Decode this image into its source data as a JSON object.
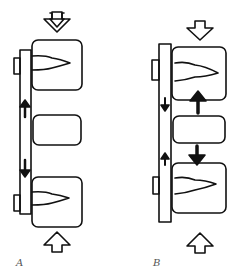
{
  "figure": {
    "panels": [
      {
        "label": "A",
        "description": "Plate spanning two bone blocks with a gap block between; arrows on plate point away from gap (distraction); compression arrows above and below"
      },
      {
        "label": "B",
        "description": "Plate with blocks compressed together; arrows on plate point toward middle; large solid arrows push outer blocks toward middle block; compression arrows above and below"
      }
    ],
    "colors": {
      "stroke": "#111111",
      "background": "#ffffff",
      "label": "#555555"
    }
  }
}
